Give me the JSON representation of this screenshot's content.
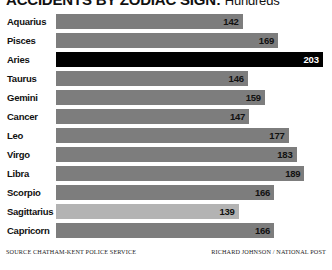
{
  "chart_data": {
    "type": "bar",
    "orientation": "horizontal",
    "title": "ACCIDENTS BY ZODIAC SIGN:",
    "subtitle": "Hundreds",
    "xlabel": "",
    "ylabel": "",
    "xlim": [
      0,
      210
    ],
    "grid": false,
    "legend": "none",
    "categories": [
      "Aquarius",
      "Pisces",
      "Aries",
      "Taurus",
      "Gemini",
      "Cancer",
      "Leo",
      "Virgo",
      "Libra",
      "Scorpio",
      "Sagittarius",
      "Capricorn"
    ],
    "values": [
      142,
      169,
      203,
      146,
      159,
      147,
      177,
      183,
      189,
      166,
      139,
      166
    ],
    "bars": [
      {
        "label": "Aquarius",
        "value": 142,
        "value_text": "142",
        "style": "normal"
      },
      {
        "label": "Pisces",
        "value": 169,
        "value_text": "169",
        "style": "normal"
      },
      {
        "label": "Aries",
        "value": 203,
        "value_text": "203",
        "style": "highlight"
      },
      {
        "label": "Taurus",
        "value": 146,
        "value_text": "146",
        "style": "normal"
      },
      {
        "label": "Gemini",
        "value": 159,
        "value_text": "159",
        "style": "normal"
      },
      {
        "label": "Cancer",
        "value": 147,
        "value_text": "147",
        "style": "normal"
      },
      {
        "label": "Leo",
        "value": 177,
        "value_text": "177",
        "style": "normal"
      },
      {
        "label": "Virgo",
        "value": 183,
        "value_text": "183",
        "style": "normal"
      },
      {
        "label": "Libra",
        "value": 189,
        "value_text": "189",
        "style": "normal"
      },
      {
        "label": "Scorpio",
        "value": 166,
        "value_text": "166",
        "style": "normal"
      },
      {
        "label": "Sagittarius",
        "value": 139,
        "value_text": "139",
        "style": "minimum"
      },
      {
        "label": "Capricorn",
        "value": 166,
        "value_text": "166",
        "style": "normal"
      }
    ],
    "colors": {
      "bar": "#7d7d7d",
      "highlight": "#000000",
      "minimum": "#b3b3b3",
      "text": "#111111",
      "background": "#ffffff"
    }
  },
  "footer": {
    "source": "SOURCE CHATHAM-KENT POLICE SERVICE",
    "credit": "RICHARD JOHNSON / NATIONAL POST"
  }
}
